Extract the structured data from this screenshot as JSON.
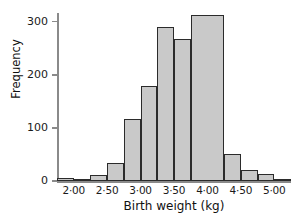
{
  "chart_data": {
    "type": "bar",
    "title": "",
    "xlabel": "Birth weight (kg)",
    "ylabel": "Frequency",
    "grid": false,
    "legend": null,
    "bin_width": 0.25,
    "xlim": [
      1.75,
      5.25
    ],
    "ylim": [
      0,
      320
    ],
    "categories": [
      "1.75-2.00",
      "2.00-2.25",
      "2.25-2.50",
      "2.50-2.75",
      "2.75-3.00",
      "3.00-3.25",
      "3.25-3.50",
      "3.50-3.75",
      "3.75-4.25",
      "4.25-4.50",
      "4.50-4.75",
      "4.75-5.00",
      "5.00-5.25"
    ],
    "bin_starts": [
      1.75,
      2.0,
      2.25,
      2.5,
      2.75,
      3.0,
      3.25,
      3.5,
      3.75,
      4.25,
      4.5,
      4.75,
      5.0
    ],
    "bin_ends": [
      2.0,
      2.25,
      2.5,
      2.75,
      3.0,
      3.25,
      3.5,
      3.75,
      4.25,
      4.5,
      4.75,
      5.0,
      5.25
    ],
    "values": [
      5,
      3,
      11,
      34,
      117,
      178,
      290,
      267,
      312,
      50,
      20,
      13,
      4
    ],
    "y_ticks": [
      0,
      100,
      200,
      300
    ],
    "y_tick_labels": [
      "0",
      "100",
      "200",
      "300"
    ],
    "x_ticks": [
      2.0,
      2.5,
      3.0,
      3.5,
      4.0,
      4.5,
      5.0
    ],
    "x_tick_labels": [
      "2·00",
      "2·50",
      "3·00",
      "3·50",
      "4·00",
      "4·50",
      "5·00"
    ],
    "colors": {
      "bar_fill": "#c9c9c9",
      "bar_edge": "#2b2b2b",
      "axis": "#8a8a8a",
      "text": "#1a1a1a",
      "background": "#ffffff"
    }
  }
}
